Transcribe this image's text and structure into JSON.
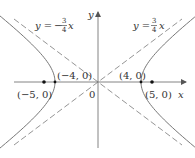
{
  "diagram": {
    "type": "hyperbola",
    "equation": "x^2/16 - y^2/9 = 1",
    "axes": {
      "x_label": "x",
      "y_label": "y",
      "origin_label": "0"
    },
    "asymptotes": [
      {
        "label_prefix": "y = ",
        "sign": "",
        "num": "3",
        "den": "4",
        "var": "x",
        "slope": 0.75
      },
      {
        "label_prefix": "y = ",
        "sign": "−",
        "num": "3",
        "den": "4",
        "var": "x",
        "slope": -0.75
      }
    ],
    "points": [
      {
        "label": "(−5, 0)",
        "x": -5,
        "y": 0,
        "kind": "focus"
      },
      {
        "label": "(−4, 0)",
        "x": -4,
        "y": 0,
        "kind": "vertex"
      },
      {
        "label": "(4, 0)",
        "x": 4,
        "y": 0,
        "kind": "vertex"
      },
      {
        "label": "(5, 0)",
        "x": 5,
        "y": 0,
        "kind": "focus"
      }
    ],
    "colors": {
      "curve": "#777777",
      "axis": "#777777",
      "dash": "#888888",
      "dot": "#111111",
      "text": "#333333"
    }
  }
}
